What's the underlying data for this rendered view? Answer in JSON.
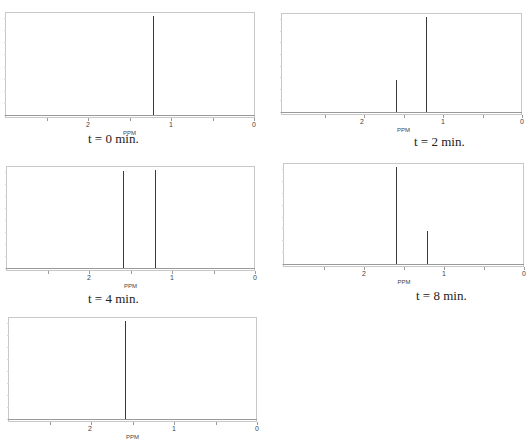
{
  "chart_data": [
    {
      "type": "line",
      "title": "t = 0 min.",
      "xlabel": "PPM",
      "ylabel": "",
      "xlim": [
        3,
        0
      ],
      "x_ticks": [
        "2",
        "1",
        "0"
      ],
      "peaks": [
        {
          "ppm": 1.22,
          "rel_height": 1.0
        }
      ],
      "frame": {
        "left": 5,
        "top": 12,
        "right": 255,
        "baseline": 115,
        "axis": 118
      },
      "tick_px": {
        "2": 88,
        "1": 171,
        "0": 254
      },
      "caption_pos": {
        "left": 88,
        "top": 131
      }
    },
    {
      "type": "line",
      "title": "t = 2 min.",
      "xlabel": "PPM",
      "ylabel": "",
      "xlim": [
        3,
        0
      ],
      "x_ticks": [
        "2",
        "1",
        "0"
      ],
      "peaks": [
        {
          "ppm": 1.59,
          "rel_height": 0.34
        },
        {
          "ppm": 1.22,
          "rel_height": 1.0
        }
      ],
      "frame": {
        "left": 281,
        "top": 13,
        "right": 522,
        "baseline": 112,
        "axis": 115
      },
      "tick_px": {
        "2": 362,
        "1": 443,
        "0": 522
      },
      "caption_pos": {
        "left": 414,
        "top": 134
      }
    },
    {
      "type": "line",
      "title": "t = 4 min.",
      "xlabel": "PPM",
      "ylabel": "",
      "xlim": [
        3,
        0
      ],
      "x_ticks": [
        "2",
        "1",
        "0"
      ],
      "peaks": [
        {
          "ppm": 1.59,
          "rel_height": 0.99
        },
        {
          "ppm": 1.2,
          "rel_height": 1.0
        }
      ],
      "frame": {
        "left": 6,
        "top": 166,
        "right": 255,
        "baseline": 268,
        "axis": 271
      },
      "tick_px": {
        "2": 89,
        "1": 172,
        "0": 255
      },
      "caption_pos": {
        "left": 88,
        "top": 291
      }
    },
    {
      "type": "line",
      "title": "t = 8 min.",
      "xlabel": "PPM",
      "ylabel": "",
      "xlim": [
        3,
        0
      ],
      "x_ticks": [
        "2",
        "1",
        "0"
      ],
      "peaks": [
        {
          "ppm": 1.6,
          "rel_height": 1.0
        },
        {
          "ppm": 1.21,
          "rel_height": 0.34
        }
      ],
      "frame": {
        "left": 283,
        "top": 163,
        "right": 524,
        "baseline": 264,
        "axis": 267
      },
      "tick_px": {
        "2": 364,
        "1": 444,
        "0": 524
      },
      "caption_pos": {
        "left": 416,
        "top": 288
      }
    },
    {
      "type": "line",
      "title": "",
      "xlabel": "PPM",
      "ylabel": "",
      "xlim": [
        3,
        0
      ],
      "x_ticks": [
        "2",
        "1",
        "0"
      ],
      "peaks": [
        {
          "ppm": 1.59,
          "rel_height": 1.0
        }
      ],
      "frame": {
        "left": 8,
        "top": 317,
        "right": 257,
        "baseline": 419,
        "axis": 422
      },
      "tick_px": {
        "2": 90,
        "1": 174,
        "0": 257
      },
      "caption_pos": null
    }
  ]
}
